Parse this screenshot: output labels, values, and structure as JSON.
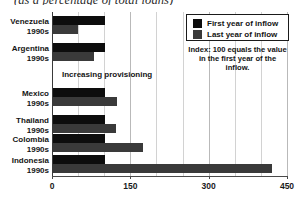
{
  "chart_data": {
    "type": "bar",
    "orientation": "horizontal",
    "title": "(as a percentage of total loans)",
    "xlabel": "",
    "ylabel": "",
    "xlim": [
      0,
      450
    ],
    "xticks": [
      0,
      150,
      300,
      450
    ],
    "xtick_labels": [
      "0",
      "150",
      "300",
      "450"
    ],
    "minor_tick_step": 50,
    "grid": true,
    "legend_position": "top-right",
    "categories": [
      "Venezuela 1990s",
      "Argentina 1990s",
      "Mexico 1990s",
      "Thailand 1990s",
      "Colombia 1990s",
      "Indonesia 1990s"
    ],
    "series": [
      {
        "name": "First year of inflow",
        "color": "#0d0d0d",
        "values": [
          100,
          100,
          100,
          100,
          100,
          100
        ]
      },
      {
        "name": "Last year of inflow",
        "color": "#3a3a3a",
        "values": [
          48,
          78,
          123,
          121,
          172,
          420
        ]
      }
    ],
    "annotations": [
      "Increasing provisioning",
      "Index: 100 equals the value in the first year of the inflow."
    ]
  },
  "categories": [
    {
      "country": "Venezuela",
      "period": "1990s",
      "first": 100,
      "last": 48
    },
    {
      "country": "Argentina",
      "period": "1990s",
      "first": 100,
      "last": 78
    },
    {
      "country": "Mexico",
      "period": "1990s",
      "first": 100,
      "last": 123
    },
    {
      "country": "Thailand",
      "period": "1990s",
      "first": 100,
      "last": 121
    },
    {
      "country": "Colombia",
      "period": "1990s",
      "first": 100,
      "last": 172
    },
    {
      "country": "Indonesia",
      "period": "1990s",
      "first": 100,
      "last": 420
    }
  ],
  "axis": {
    "ticks": [
      "0",
      "150",
      "300",
      "450"
    ]
  },
  "legend": {
    "items": [
      {
        "label": "First year of inflow",
        "color": "#0d0d0d"
      },
      {
        "label": "Last year of inflow",
        "color": "#3a3a3a"
      }
    ],
    "note": "Index: 100 equals the value in the first year of the inflow."
  },
  "annotation": {
    "provisioning": "Increasing provisioning"
  },
  "colors": {
    "first_year": "#0d0d0d",
    "last_year": "#3a3a3a",
    "gridline": "#d2d2d2",
    "axis": "#4a4a4a",
    "text": "#141414",
    "background": "#ffffff"
  }
}
